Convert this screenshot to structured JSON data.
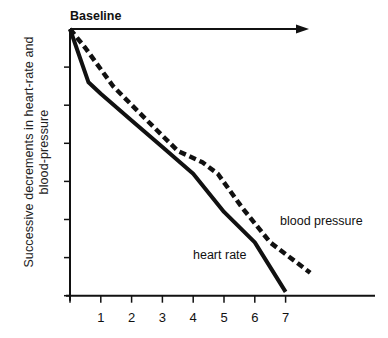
{
  "chart_data": {
    "type": "line",
    "title": "Baseline",
    "xlabel": "",
    "ylabel": "Successive decrements in heart-rate and blood-pressure",
    "x_ticks": [
      "1",
      "2",
      "3",
      "4",
      "5",
      "6",
      "7"
    ],
    "xlim": [
      0,
      8
    ],
    "ylim": [
      -7,
      0
    ],
    "y_tick_count": 7,
    "y_tick_labels": [],
    "grid": false,
    "legend": "inline annotations",
    "series": [
      {
        "name": "heart rate",
        "style": "solid",
        "x": [
          0,
          0.6,
          1.0,
          2.0,
          3.0,
          4.0,
          5.0,
          6.0,
          7.0
        ],
        "y": [
          0,
          -1.4,
          -1.7,
          -2.4,
          -3.1,
          -3.8,
          -4.8,
          -5.6,
          -6.9
        ]
      },
      {
        "name": "blood pressure",
        "style": "dashed",
        "x": [
          0,
          0.5,
          1.4,
          2.5,
          3.5,
          4.3,
          4.8,
          5.6,
          6.5,
          7.8
        ],
        "y": [
          0,
          -0.5,
          -1.5,
          -2.4,
          -3.2,
          -3.5,
          -3.8,
          -4.7,
          -5.6,
          -6.4
        ]
      }
    ],
    "annotations": [
      {
        "text": "heart rate",
        "x": 4.0,
        "y": -6.0
      },
      {
        "text": "blood pressure",
        "x": 6.6,
        "y": -5.1
      }
    ]
  },
  "labels": {
    "title": "Baseline",
    "ylabel_line1": "Successive decrements in heart-rate and",
    "ylabel_line2": "blood-pressure",
    "heart_rate": "heart rate",
    "blood_pressure": "blood pressure"
  }
}
